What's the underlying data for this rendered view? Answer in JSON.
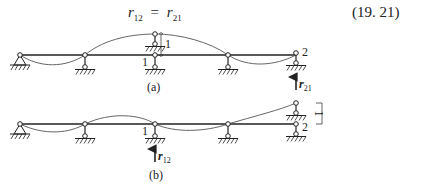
{
  "equation": {
    "lhs_symbol": "r",
    "lhs_sub": "12",
    "operator": "=",
    "rhs_symbol": "r",
    "rhs_sub": "21",
    "number": "(19. 21)"
  },
  "diagram_a": {
    "caption": "(a)",
    "node1_label": "1",
    "node2_label": "2",
    "displacement_label": "1",
    "reaction_symbol": "r",
    "reaction_sub": "21"
  },
  "diagram_b": {
    "caption": "(b)",
    "node1_label": "1",
    "node2_label": "2",
    "displacement_label": "1",
    "reaction_symbol": "r",
    "reaction_sub": "12"
  },
  "colors": {
    "line": "#222222",
    "curve": "#555555"
  }
}
